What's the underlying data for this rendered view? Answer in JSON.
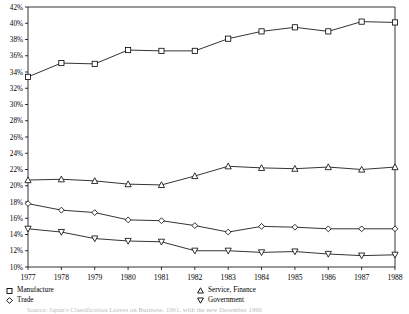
{
  "chart_data": {
    "type": "line",
    "title": "",
    "subtitle": "",
    "xlabel": "",
    "ylabel": "",
    "categories": [
      "1977",
      "1978",
      "1979",
      "1980",
      "1981",
      "1982",
      "1983",
      "1984",
      "1985",
      "1986",
      "1987",
      "1988"
    ],
    "x_tick_labels": [
      "1977",
      "1978",
      "1979",
      "1980",
      "1981",
      "1982",
      "1983",
      "1984",
      "1985",
      "1986",
      "1987",
      "1988"
    ],
    "y_tick_labels": [
      "10%",
      "12%",
      "14%",
      "16%",
      "18%",
      "20%",
      "22%",
      "24%",
      "26%",
      "28%",
      "30%",
      "32%",
      "34%",
      "36%",
      "38%",
      "40%",
      "42%"
    ],
    "y_tick_values": [
      10,
      12,
      14,
      16,
      18,
      20,
      22,
      24,
      26,
      28,
      30,
      32,
      34,
      36,
      38,
      40,
      42
    ],
    "ylim": [
      10,
      42
    ],
    "y_unit": "%",
    "grid": false,
    "legend_position": "below",
    "series": [
      {
        "name": "Manufacture",
        "marker": "square",
        "color": "#000000",
        "values": [
          33.4,
          35.1,
          35.0,
          36.7,
          36.6,
          36.6,
          38.1,
          39.0,
          39.5,
          39.0,
          40.2,
          40.1
        ]
      },
      {
        "name": "Service, Finance",
        "marker": "triangle-up",
        "color": "#000000",
        "values": [
          20.7,
          20.8,
          20.6,
          20.2,
          20.1,
          21.2,
          22.4,
          22.2,
          22.1,
          22.3,
          22.0,
          22.3
        ]
      },
      {
        "name": "Trade",
        "marker": "diamond",
        "color": "#000000",
        "values": [
          17.8,
          17.0,
          16.7,
          15.8,
          15.7,
          15.1,
          14.3,
          15.0,
          14.9,
          14.7,
          14.7,
          14.7
        ]
      },
      {
        "name": "Government",
        "marker": "triangle-down",
        "color": "#000000",
        "values": [
          14.7,
          14.3,
          13.5,
          13.2,
          13.1,
          12.0,
          12.0,
          11.8,
          11.9,
          11.6,
          11.4,
          11.5
        ]
      }
    ]
  },
  "legend": {
    "entries": [
      {
        "label": "Manufacture",
        "marker": "square"
      },
      {
        "label": "Trade",
        "marker": "diamond"
      },
      {
        "label": "Service, Finance",
        "marker": "triangle-up"
      },
      {
        "label": "Government",
        "marker": "triangle-down"
      }
    ]
  },
  "footer": {
    "source": "Source: Japan's Classification Leaves on Business, 1991, with the new December 1990"
  },
  "axes": {
    "line_color": "#000000",
    "plot_background": "#ffffff"
  }
}
